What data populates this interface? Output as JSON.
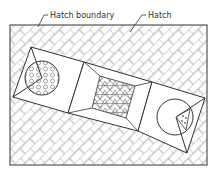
{
  "labels": {
    "boundary": "Hatch boundary",
    "hatch": "Hatch"
  },
  "colors": {
    "line": "#333333",
    "hatch": "#888888",
    "background": "#ffffff"
  },
  "outer_boundary": {
    "x": 10,
    "y": 25,
    "width": 197,
    "height": 140
  },
  "strip": {
    "left_box": "31,47 84,62 68,113 13,97",
    "middle_box": "84,62 152,82 138,131 68,113",
    "right_box": "152,82 205,98 187,153 138,131"
  },
  "islands": {
    "left_circle": {
      "cx": 42,
      "cy": 78,
      "r": 17,
      "pattern": "hexagon"
    },
    "middle_inner": "100,76 135,86 126,118 92,108",
    "right_circle": {
      "cx": 175,
      "cy": 117,
      "r": 18
    },
    "right_triangle": "176,117 190,109 186,130"
  }
}
